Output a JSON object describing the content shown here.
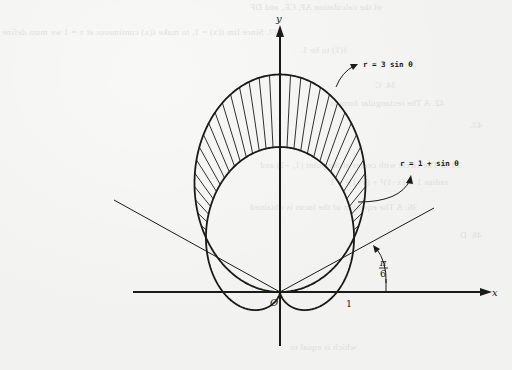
{
  "figure": {
    "curves": [
      {
        "id": "circle",
        "label": "r = 3 sin θ",
        "equation": "r = 3 sin θ"
      },
      {
        "id": "cardioid",
        "label": "r = 1 + sin θ",
        "equation": "r = 1 + sin θ"
      }
    ],
    "shaded_region": "inside r = 3 sin θ, outside r = 1 + sin θ",
    "intersection_angles": [
      "π/6",
      "5π/6"
    ],
    "angle_label": {
      "numerator": "π",
      "denominator": "6"
    },
    "axes": {
      "x_label": "x",
      "y_label": "y",
      "origin_label": "O",
      "x_tick_label": "1"
    },
    "colors": {
      "ink": "#1a1a1a",
      "paper": "#f2f2f0"
    }
  },
  "bleed_through": [
    "of the calculation AP, CE, and DF",
    "23.  Since lim f(x) = 1, to make f(x) continuous at x = 1 we must define",
    "f(1) to be 1.",
    "34.  C",
    "42.  A      The rectangular form is",
    "43.",
    "30.  B      The circle with center at the point (1, −1) and",
    "radius 1 is (x−1)² + (y+1)² = 1",
    "36.  A      The equation of the locus is obtained",
    "46.  D",
    "which is equal to"
  ]
}
